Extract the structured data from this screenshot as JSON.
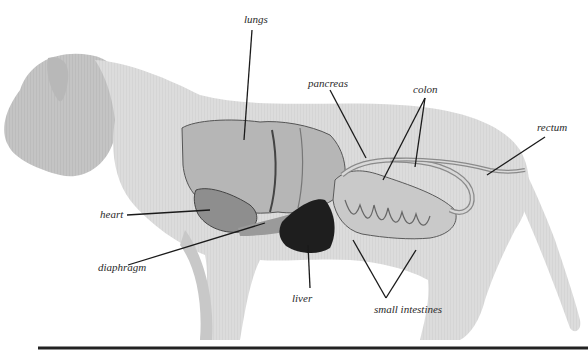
{
  "figure": {
    "labels": {
      "lungs": "lungs",
      "pancreas": "pancreas",
      "colon": "colon",
      "rectum": "rectum",
      "heart": "heart",
      "diaphragm": "diaphragm",
      "liver": "liver",
      "small_intestines": "small intestines"
    }
  },
  "colors": {
    "body_fill": "#d9d9d9",
    "body_shade": "#bdbdbd",
    "organ_fill": "#a8a8a8",
    "liver_fill": "#1e1e1e",
    "line": "#1a1a1a",
    "ground_line": "#222222"
  }
}
